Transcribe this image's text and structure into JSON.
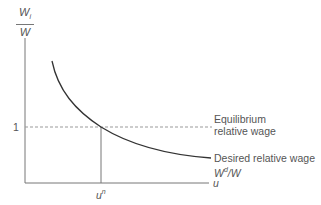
{
  "diagram": {
    "y_axis_label": {
      "numerator": "W",
      "numerator_sub": "i",
      "denominator": "W"
    },
    "x_axis_label": "u",
    "y_tick_label": "1",
    "x_tick_label": {
      "base": "u",
      "sup": "n"
    },
    "equilibrium_label": [
      "Equilibrium",
      "relative wage"
    ],
    "desired_label": {
      "line1": "Desired relative wage",
      "symbol_base": "W",
      "symbol_sup": "d",
      "symbol_rest": "/W"
    },
    "colors": {
      "axis": "#777777",
      "curve": "#333333",
      "dashed": "#999999",
      "text": "#555555"
    }
  }
}
